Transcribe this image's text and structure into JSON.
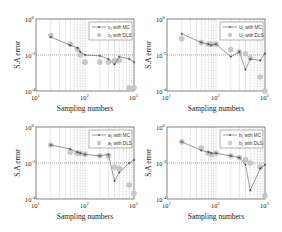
{
  "figure": {
    "ylabel": "S.A error",
    "xlabel": "Sampling numbers",
    "x_ticks": [
      "10",
      "10",
      "10"
    ],
    "x_tick_exps": [
      "1",
      "2",
      "3"
    ],
    "y_ticks": [
      "10",
      "10",
      "10"
    ],
    "y_tick_exps": [
      "0",
      "-2",
      "-4"
    ],
    "colors": {
      "mc_line": "#555555",
      "dls_marker": "#c8c8c8",
      "grid": "#888888",
      "axes": "#333333"
    }
  },
  "chart_data": [
    {
      "type": "line",
      "title": "",
      "xlabel": "Sampling numbers",
      "ylabel": "S.A error",
      "xscale": "log",
      "yscale": "log",
      "xlim": [
        10,
        1000
      ],
      "ylim": [
        0.0001,
        1
      ],
      "grid": "dotted vertical minor + horizontal at 1e-2",
      "legend_position": "upper right",
      "x": [
        20,
        50,
        70,
        80,
        100,
        200,
        300,
        400,
        500,
        800,
        1000
      ],
      "series": [
        {
          "name": "x₁ with MC",
          "style": "line-marker",
          "values": [
            0.1,
            0.035,
            0.025,
            0.015,
            0.01,
            0.009,
            0.006,
            0.003,
            0.008,
            0.006,
            0.004
          ]
        },
        {
          "name": "x₁ with DLS",
          "style": "marker",
          "values": [
            0.12,
            0.04,
            0.02,
            0.01,
            0.004,
            0.004,
            0.004,
            0.005,
            0.005,
            0.00015,
            0.00015
          ]
        }
      ]
    },
    {
      "type": "line",
      "title": "",
      "xlabel": "Sampling numbers",
      "ylabel": "S.A error",
      "xscale": "log",
      "yscale": "log",
      "xlim": [
        10,
        1000
      ],
      "ylim": [
        0.0001,
        1
      ],
      "grid": "dotted vertical minor + horizontal at 1e-2",
      "legend_position": "upper right",
      "x": [
        20,
        50,
        70,
        80,
        100,
        200,
        300,
        400,
        500,
        800,
        1000
      ],
      "series": [
        {
          "name": "U₁ with MC",
          "style": "line-marker",
          "values": [
            0.15,
            0.05,
            0.04,
            0.035,
            0.04,
            0.008,
            0.015,
            0.0015,
            0.006,
            0.005,
            0.012
          ]
        },
        {
          "name": "U₁ with DLS",
          "style": "marker",
          "values": [
            0.08,
            0.05,
            0.04,
            0.04,
            0.04,
            0.02,
            0.015,
            0.012,
            0.007,
            0.0006,
            0.0001
          ]
        }
      ]
    },
    {
      "type": "line",
      "title": "",
      "xlabel": "Sampling numbers",
      "ylabel": "S.A error",
      "xscale": "log",
      "yscale": "log",
      "xlim": [
        10,
        1000
      ],
      "ylim": [
        0.0001,
        1
      ],
      "grid": "dotted vertical minor + horizontal at 1e-2",
      "legend_position": "upper right",
      "x": [
        20,
        50,
        70,
        80,
        100,
        200,
        300,
        400,
        500,
        800,
        1000
      ],
      "series": [
        {
          "name": "a₁ with MC",
          "style": "line-marker",
          "values": [
            0.1,
            0.06,
            0.04,
            0.035,
            0.03,
            0.025,
            0.03,
            0.001,
            0.003,
            0.01,
            0.015
          ]
        },
        {
          "name": "a₁ with DLS",
          "style": "marker",
          "values": [
            0.1,
            0.04,
            0.035,
            0.035,
            0.03,
            0.025,
            0.025,
            0.006,
            0.005,
            0.0006,
            0.0002
          ]
        }
      ]
    },
    {
      "type": "line",
      "title": "",
      "xlabel": "Sampling numbers",
      "ylabel": "S.A error",
      "xscale": "log",
      "yscale": "log",
      "xlim": [
        10,
        1000
      ],
      "ylim": [
        0.0001,
        1
      ],
      "grid": "dotted vertical minor + horizontal at 1e-2",
      "legend_position": "upper right",
      "x": [
        20,
        50,
        70,
        80,
        100,
        200,
        300,
        400,
        500,
        800,
        1000
      ],
      "series": [
        {
          "name": "b₁ with MC",
          "style": "line-marker",
          "values": [
            0.15,
            0.05,
            0.04,
            0.035,
            0.035,
            0.025,
            0.02,
            0.008,
            0.0003,
            0.005,
            0.008
          ]
        },
        {
          "name": "b₁ with DLS",
          "style": "marker",
          "values": [
            0.15,
            0.07,
            0.035,
            0.03,
            0.035,
            0.025,
            0.02,
            0.015,
            0.01,
            0.006,
            0.00015
          ]
        }
      ]
    }
  ]
}
